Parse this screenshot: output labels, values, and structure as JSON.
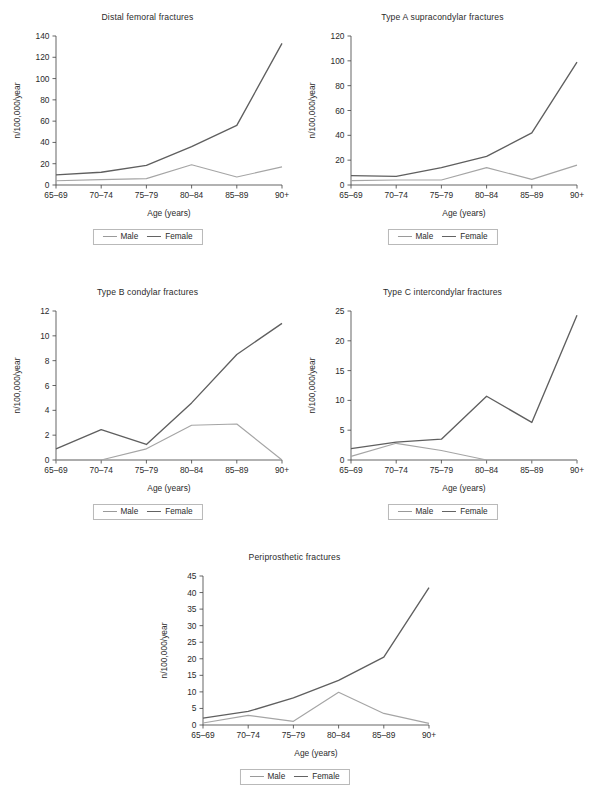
{
  "figure": {
    "axis_x_label": "Age (years)",
    "axis_y_label": "n/100,000/year",
    "categories": [
      "65–69",
      "70–74",
      "75–79",
      "80–84",
      "85–89",
      "90+"
    ],
    "legend": {
      "male": "Male",
      "female": "Female"
    },
    "colors": {
      "male": "#a5a5a5",
      "female": "#5f5f5f",
      "axis": "#4a4a4a",
      "text": "#2b2b2b",
      "background": "#ffffff"
    }
  },
  "chart_data": [
    {
      "type": "line",
      "id": "distal-femoral-fractures",
      "title": "Distal femoral fractures",
      "xlabel": "Age (years)",
      "ylabel": "n/100,000/year",
      "categories": [
        "65–69",
        "70–74",
        "75–79",
        "80–84",
        "85–89",
        "90+"
      ],
      "ylim": [
        0,
        140
      ],
      "yticks": [
        0,
        20,
        40,
        60,
        80,
        100,
        120,
        140
      ],
      "grid": false,
      "legend_position": "below",
      "series": [
        {
          "name": "Male",
          "values": [
            4,
            5,
            6,
            19,
            7.5,
            17
          ]
        },
        {
          "name": "Female",
          "values": [
            9.5,
            12,
            18.5,
            36,
            56,
            133
          ]
        }
      ]
    },
    {
      "type": "line",
      "id": "type-a-supracondylar-fractures",
      "title": "Type A supracondylar fractures",
      "xlabel": "Age (years)",
      "ylabel": "n/100,000/year",
      "categories": [
        "65–69",
        "70–74",
        "75–79",
        "80–84",
        "85–89",
        "90+"
      ],
      "ylim": [
        0,
        120
      ],
      "yticks": [
        0,
        20,
        40,
        60,
        80,
        100,
        120
      ],
      "grid": false,
      "legend_position": "below",
      "series": [
        {
          "name": "Male",
          "values": [
            3.5,
            4,
            4,
            14,
            4.5,
            16
          ]
        },
        {
          "name": "Female",
          "values": [
            7.5,
            7,
            14,
            23,
            42,
            99
          ]
        }
      ]
    },
    {
      "type": "line",
      "id": "type-b-condylar-fractures",
      "title": "Type B condylar fractures",
      "xlabel": "Age (years)",
      "ylabel": "n/100,000/year",
      "categories": [
        "65–69",
        "70–74",
        "75–79",
        "80–84",
        "85–89",
        "90+"
      ],
      "ylim": [
        0,
        12
      ],
      "yticks": [
        0,
        2,
        4,
        6,
        8,
        10,
        12
      ],
      "grid": false,
      "legend_position": "below",
      "series": [
        {
          "name": "Male",
          "values": [
            0,
            0,
            0.9,
            2.8,
            2.9,
            0
          ]
        },
        {
          "name": "Female",
          "values": [
            0.9,
            2.45,
            1.25,
            4.6,
            8.5,
            11
          ]
        }
      ]
    },
    {
      "type": "line",
      "id": "type-c-intercondylar-fractures",
      "title": "Type C intercondylar fractures",
      "xlabel": "Age (years)",
      "ylabel": "n/100,000/year",
      "categories": [
        "65–69",
        "70–74",
        "75–79",
        "80–84",
        "85–89",
        "90+"
      ],
      "ylim": [
        0,
        25
      ],
      "yticks": [
        0,
        5,
        10,
        15,
        20,
        25
      ],
      "grid": false,
      "legend_position": "below",
      "series": [
        {
          "name": "Male",
          "values": [
            0.6,
            2.8,
            1.6,
            0,
            0,
            0
          ]
        },
        {
          "name": "Female",
          "values": [
            1.9,
            3.0,
            3.5,
            10.7,
            6.3,
            24.3
          ]
        }
      ]
    },
    {
      "type": "line",
      "id": "periprosthetic-fractures",
      "title": "Periprosthetic fractures",
      "xlabel": "Age (years)",
      "ylabel": "n/100,000/year",
      "categories": [
        "65–69",
        "70–74",
        "75–79",
        "80–84",
        "85–89",
        "90+"
      ],
      "ylim": [
        0,
        45
      ],
      "yticks": [
        0,
        5,
        10,
        15,
        20,
        25,
        30,
        35,
        40,
        45
      ],
      "grid": false,
      "legend_position": "below",
      "series": [
        {
          "name": "Male",
          "values": [
            0.6,
            2.9,
            1.1,
            9.9,
            3.5,
            0.5
          ]
        },
        {
          "name": "Female",
          "values": [
            2.1,
            4.1,
            8.2,
            13.5,
            20.5,
            41.5
          ]
        }
      ]
    }
  ]
}
